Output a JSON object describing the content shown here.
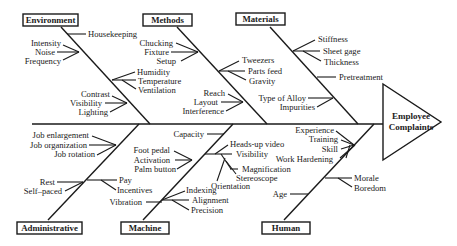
{
  "effect": {
    "line1": "Employee",
    "line2": "Complaints"
  },
  "categories": {
    "environment": {
      "label": "Environment",
      "causes": [
        "Housekeeping",
        "Intensity",
        "Noise",
        "Frequency",
        "Humidity",
        "Temperature",
        "Ventilation",
        "Contrast",
        "Visibility",
        "Lighting"
      ]
    },
    "methods": {
      "label": "Methods",
      "causes": [
        "Chucking",
        "Fixture",
        "Setup",
        "Tweezers",
        "Parts feed",
        "Gravity",
        "Reach",
        "Layout",
        "Interference"
      ]
    },
    "materials": {
      "label": "Materials",
      "causes": [
        "Stiffness",
        "Sheet gage",
        "Thickness",
        "Pretreatment",
        "Type of Alloy",
        "Impurities"
      ]
    },
    "administrative": {
      "label": "Administrative",
      "causes": [
        "Job enlargement",
        "Job organization",
        "Job rotation",
        "Rest",
        "Self–paced",
        "Pay",
        "Incentives"
      ]
    },
    "machine": {
      "label": "Machine",
      "causes": [
        "Capacity",
        "Foot pedal",
        "Activation",
        "Palm button",
        "Heads-up video",
        "Visibility",
        "Magnification",
        "Stereoscope",
        "Orientation",
        "Vibration",
        "Indexing",
        "Alignment",
        "Precision"
      ]
    },
    "human": {
      "label": "Human",
      "causes": [
        "Experience",
        "Training",
        "Skill",
        "Work Hardening",
        "Morale",
        "Boredom",
        "Age"
      ]
    }
  }
}
